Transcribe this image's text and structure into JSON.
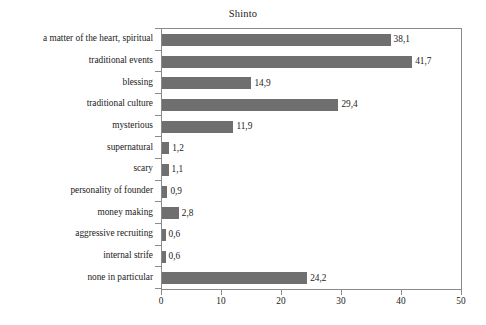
{
  "chart_data": {
    "type": "bar",
    "orientation": "horizontal",
    "title": "Shinto",
    "xlabel": "",
    "ylabel": "",
    "xlim": [
      0,
      50
    ],
    "xticks": [
      "0",
      "10",
      "20",
      "30",
      "40",
      "50"
    ],
    "grid": false,
    "legend": null,
    "decimal_separator": ",",
    "bar_color": "#6f6f6f",
    "frame_color": "#8a8a8a",
    "background": "#ffffff",
    "categories": [
      "a matter of the heart, spiritual",
      "traditional events",
      "blessing",
      "traditional culture",
      "mysterious",
      "supernatural",
      "scary",
      "personality of founder",
      "money making",
      "aggressive recruiting",
      "internal strife",
      "none in particular"
    ],
    "values": [
      38.1,
      41.7,
      14.9,
      29.4,
      11.9,
      1.2,
      1.1,
      0.9,
      2.8,
      0.6,
      0.6,
      24.2
    ],
    "value_labels": [
      "38,1",
      "41,7",
      "14,9",
      "29,4",
      "11,9",
      "1,2",
      "1,1",
      "0,9",
      "2,8",
      "0,6",
      "0,6",
      "24,2"
    ]
  }
}
